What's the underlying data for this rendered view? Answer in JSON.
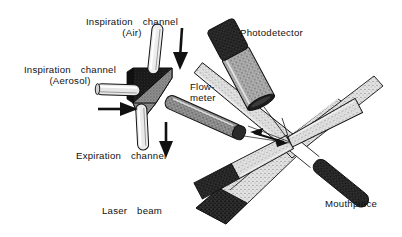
{
  "figure": {
    "background_color": "#ffffff",
    "ink_color": "#111111"
  },
  "labels": {
    "inspiration_air": "Inspiration  channel\n(Air)",
    "inspiration_aerosol": "Inspiration  channel\n(Aerosol)",
    "expiration": "Expiration  channel",
    "flowmeter": "Flow-\nmeter",
    "photodetector": "Photodetector",
    "laser_beam": "Laser  beam",
    "mouthpiece": "Mouthpiece"
  },
  "components": {
    "manifold": {
      "name": "valve-block",
      "body_color": "#1a1a1a",
      "face_color": "#8a8a8a"
    },
    "air_tube": {
      "name": "inspiration-air-tube",
      "color": "#e8e8e8",
      "outline": "#111111"
    },
    "aerosol_tube": {
      "name": "inspiration-aerosol-tube",
      "color": "#e0e0e0",
      "outline": "#111111"
    },
    "expiration_tube": {
      "name": "expiration-tube",
      "color": "#e4e4e4",
      "outline": "#111111"
    },
    "flowmeter_tube": {
      "name": "flowmeter-tube",
      "color": "#9c9c9c",
      "tip_color": "#2a2a2a"
    },
    "photodetector": {
      "name": "photodetector-cylinder",
      "cap_color": "#151515",
      "body_color": "#a6a6a6",
      "aperture_color": "#1a1a1a"
    },
    "laser_rod": {
      "name": "laser-beam-rod",
      "body_color": "#cfcfcf",
      "tip_color": "#151515"
    },
    "mouthpiece_rod": {
      "name": "mouthpiece-rod",
      "body_color": "#c9c9c9",
      "tip_color": "#2a2a2a"
    }
  },
  "arrows": {
    "air_flow": "down-arrow",
    "aerosol_flow": "right-arrow",
    "expiration_flow": "down-arrow",
    "measurement_span": "double-headed-arrow"
  },
  "geometry": {
    "beam_crossing_x": 290,
    "beam_crossing_y": 142
  }
}
